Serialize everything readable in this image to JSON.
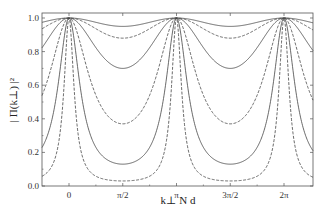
{
  "chart_data": {
    "type": "line",
    "title": "",
    "xlabel": "k⊥ N d",
    "ylabel": "| Π(k⊥) |²",
    "xlim": [
      -0.95,
      7.33
    ],
    "ylim": [
      0.0,
      1.05
    ],
    "x_ticks": [
      {
        "value": 0,
        "label": "0"
      },
      {
        "value": 1.5708,
        "label": "π/2"
      },
      {
        "value": 3.1416,
        "label": "π"
      },
      {
        "value": 4.7124,
        "label": "3π/2"
      },
      {
        "value": 6.2832,
        "label": "2π"
      }
    ],
    "y_ticks": [
      {
        "value": 0.0,
        "label": "0.0"
      },
      {
        "value": 0.2,
        "label": "0.2"
      },
      {
        "value": 0.4,
        "label": "0.4"
      },
      {
        "value": 0.6,
        "label": "0.6"
      },
      {
        "value": 0.8,
        "label": "0.8"
      },
      {
        "value": 1.0,
        "label": "1.0"
      }
    ],
    "grid": false,
    "legend": null,
    "function_form": "y = 1 / (1 + F sin^2(x)), peaks of 1.0 at 0, π, 2π",
    "series": [
      {
        "name": "curve-1",
        "style": "solid",
        "min_value": 0.95
      },
      {
        "name": "curve-2",
        "style": "dashed",
        "min_value": 0.88
      },
      {
        "name": "curve-3",
        "style": "solid",
        "min_value": 0.7
      },
      {
        "name": "curve-4",
        "style": "dashed",
        "min_value": 0.37
      },
      {
        "name": "curve-5",
        "style": "solid",
        "min_value": 0.13
      },
      {
        "name": "curve-6",
        "style": "dashed",
        "min_value": 0.03
      }
    ]
  },
  "colors": {
    "line": "#444444",
    "axis": "#555555"
  }
}
